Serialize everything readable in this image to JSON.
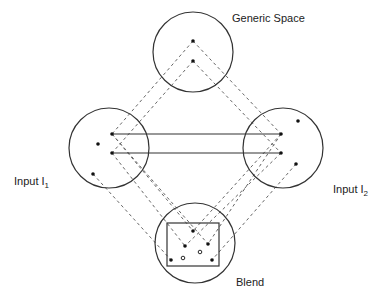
{
  "labels": {
    "generic": "Generic Space",
    "input1_prefix": "Input  I",
    "input1_sub": "1",
    "input2_prefix": "Input  I",
    "input2_sub": "2",
    "blend": "Blend"
  },
  "spaces": [
    {
      "id": "generic",
      "points": 2
    },
    {
      "id": "input1",
      "points": 4
    },
    {
      "id": "input2",
      "points": 4
    },
    {
      "id": "blend",
      "points": 7,
      "hollow_points": 2,
      "has_frame": true
    }
  ],
  "colors": {
    "stroke": "#333333",
    "dash": "#666666",
    "text": "#222222"
  }
}
